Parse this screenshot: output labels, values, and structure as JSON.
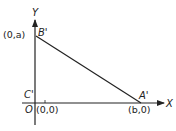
{
  "diagram": {
    "axes": {
      "x_label": "X",
      "y_label": "Y",
      "origin_label": "O"
    },
    "points": [
      {
        "name": "B'",
        "coord": "(0,a)"
      },
      {
        "name": "C'",
        "coord": "(0,0)"
      },
      {
        "name": "A'",
        "coord": "(b,0)"
      }
    ],
    "segment": {
      "from": "B'",
      "to": "A'"
    },
    "colors": {
      "stroke": "#222222",
      "background": "#ffffff"
    }
  }
}
